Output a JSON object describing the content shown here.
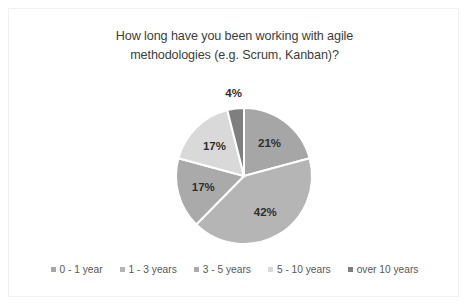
{
  "chart_data": {
    "type": "pie",
    "title": "How long have you been working with agile methodologies (e.g. Scrum, Kanban)?",
    "title_line1": "How long have you been working with agile",
    "title_line2": "methodologies (e.g. Scrum, Kanban)?",
    "xlabel": "",
    "ylabel": "",
    "legend_position": "bottom",
    "grid": false,
    "start_angle_deg": 0,
    "direction": "clockwise",
    "categories": [
      "0 - 1 year",
      "1 - 3 years",
      "3 - 5 years",
      "5 - 10 years",
      "over 10 years"
    ],
    "values": [
      21,
      42,
      17,
      17,
      4
    ],
    "value_labels": [
      "21%",
      "42%",
      "17%",
      "17%",
      "4%"
    ],
    "colors": [
      "#a6a6a6",
      "#b5b5b5",
      "#aaaaaa",
      "#d9d9d9",
      "#7f7f7f"
    ],
    "slices": [
      {
        "label": "0 - 1 year",
        "value": 21,
        "display": "21%",
        "color": "#a6a6a6"
      },
      {
        "label": "1 - 3 years",
        "value": 42,
        "display": "42%",
        "color": "#b5b5b5"
      },
      {
        "label": "3 - 5 years",
        "value": 17,
        "display": "17%",
        "color": "#aaaaaa"
      },
      {
        "label": "5 - 10 years",
        "value": 17,
        "display": "17%",
        "color": "#d9d9d9"
      },
      {
        "label": "over 10 years",
        "value": 4,
        "display": "4%",
        "color": "#7f7f7f"
      }
    ]
  },
  "legend": {
    "items": [
      {
        "label": "0 - 1 year",
        "color": "#a6a6a6"
      },
      {
        "label": "1 - 3 years",
        "color": "#b5b5b5"
      },
      {
        "label": "3 - 5 years",
        "color": "#aaaaaa"
      },
      {
        "label": "5 - 10 years",
        "color": "#d9d9d9"
      },
      {
        "label": "over 10 years",
        "color": "#7f7f7f"
      }
    ]
  }
}
